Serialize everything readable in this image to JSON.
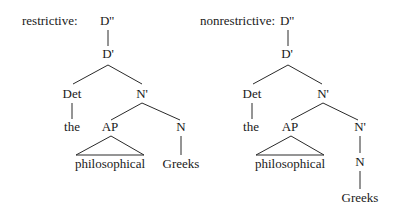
{
  "diagram": {
    "type": "syntax-trees",
    "trees": [
      {
        "caption": "restrictive:",
        "nodes": {
          "root": "D''",
          "dbar": "D'",
          "det": "Det",
          "det_word": "the",
          "nbar": "N'",
          "ap": "AP",
          "ap_word": "philosophical",
          "n": "N",
          "n_word": "Greeks"
        }
      },
      {
        "caption": "nonrestrictive:",
        "nodes": {
          "root": "D''",
          "dbar": "D'",
          "det": "Det",
          "det_word": "the",
          "nbar": "N'",
          "ap": "AP",
          "ap_word": "philosophical",
          "nbar2": "N'",
          "n": "N",
          "n_word": "Greeks"
        }
      }
    ]
  }
}
